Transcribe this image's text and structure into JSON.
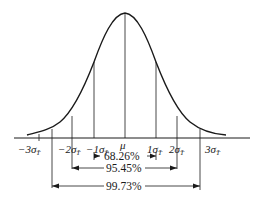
{
  "diagram": {
    "axis_labels": [
      {
        "key": "neg3",
        "text": "−3σ",
        "sub": "T̄",
        "x": 30
      },
      {
        "key": "neg2",
        "text": "−2σ",
        "sub": "T̄",
        "x": 62
      },
      {
        "key": "neg1",
        "text": "−1σ",
        "sub": "T̄",
        "x": 88
      },
      {
        "key": "mu",
        "text": "μ",
        "sub": "",
        "x": 123
      },
      {
        "key": "pos1",
        "text": "1σ",
        "sub": "T̄",
        "x": 150
      },
      {
        "key": "pos2",
        "text": "2σ",
        "sub": "T̄",
        "x": 172
      },
      {
        "key": "pos3",
        "text": "3σ",
        "sub": "T̄",
        "x": 209
      }
    ],
    "intervals": [
      {
        "key": "one_sigma",
        "label": "68.26%"
      },
      {
        "key": "two_sigma",
        "label": "95.45%"
      },
      {
        "key": "three_sigma",
        "label": "99.73%"
      }
    ],
    "colors": {
      "line": "#1a1a1a",
      "background": "#ffffff"
    }
  }
}
